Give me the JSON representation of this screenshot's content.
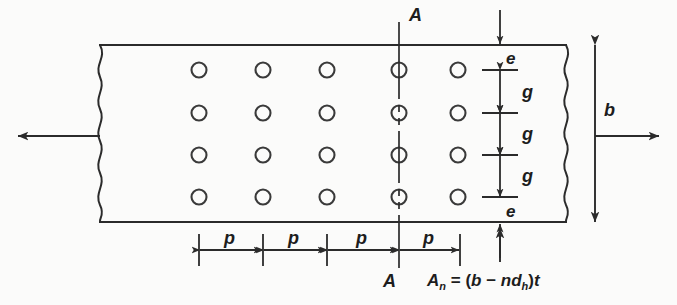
{
  "figure": {
    "type": "engineering-diagram",
    "colors": {
      "background": "#fbfbfa",
      "line": "#2b2b2b",
      "hole_stroke": "#3a3a3a"
    }
  },
  "plate": {
    "top_edge_y": 45,
    "bottom_edge_y": 222,
    "left_break_x": 100,
    "right_break_x": 565,
    "hole_columns_x": [
      199,
      263,
      327,
      399,
      458
    ],
    "hole_rows_y": [
      70,
      113,
      155,
      197
    ],
    "hole_radius": 7.5,
    "hole_count": 20
  },
  "section": {
    "label_top": "A",
    "label_bottom": "A",
    "line_x": 399
  },
  "loads": {
    "left_arrow_label": "",
    "right_arrow_label": ""
  },
  "dimensions": {
    "pitch_label": "p",
    "pitch_count": 4,
    "pitch_values": [
      "p",
      "p",
      "p",
      "p"
    ],
    "gage_label": "g",
    "gage_count": 3,
    "gage_values": [
      "g",
      "g",
      "g"
    ],
    "edge_label": "e",
    "edge_top_value": "e",
    "edge_bottom_value": "e",
    "width_label": "b"
  },
  "equation": {
    "lhs": "A",
    "lhs_sub": "n",
    "eq": " = (",
    "term_b": "b",
    "minus": " − ",
    "term_n": "n",
    "term_d": "d",
    "term_d_sub": "h",
    "close": ")",
    "term_t": "t",
    "full_text": "An = (b − ndh)t"
  }
}
